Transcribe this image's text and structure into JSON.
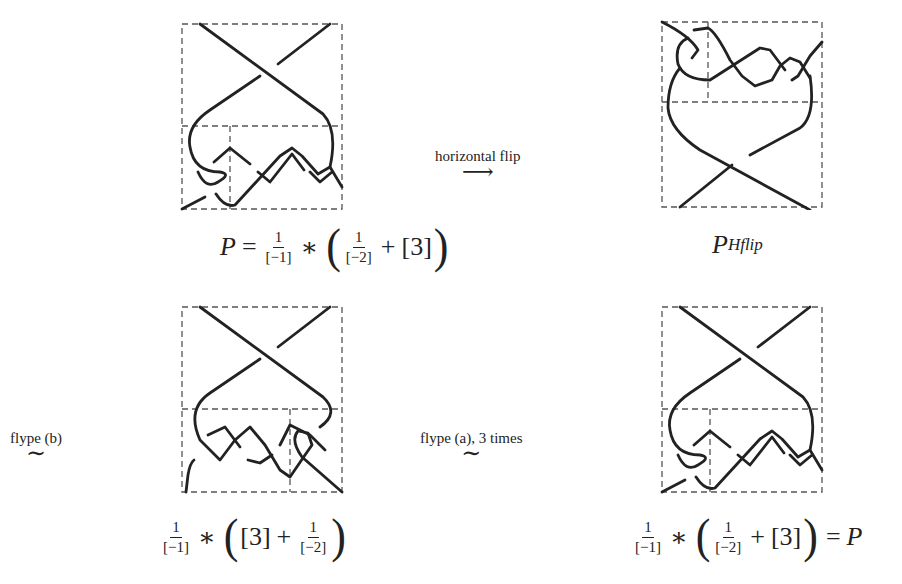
{
  "diagrams": [
    {
      "id": "P",
      "position": "top-left",
      "tangle": "lower-braid-with-curl-left",
      "formula": {
        "lhs": "P",
        "eq": "=",
        "frac1": {
          "num": "1",
          "den": "[−1]"
        },
        "star": "∗",
        "frac2": {
          "num": "1",
          "den": "[−2]"
        },
        "plus": "+",
        "term": "[3]"
      }
    },
    {
      "id": "P-Hflip",
      "position": "top-right",
      "tangle": "upper-braid-with-curl-left",
      "formula": {
        "base": "P",
        "superscript": "Hflip"
      }
    },
    {
      "id": "flype-b-result",
      "position": "bottom-left",
      "tangle": "lower-braid-with-curl-right",
      "formula": {
        "frac1": {
          "num": "1",
          "den": "[−1]"
        },
        "star": "∗",
        "term": "[3]",
        "plus": "+",
        "frac2": {
          "num": "1",
          "den": "[−2]"
        }
      }
    },
    {
      "id": "flype-a-result",
      "position": "bottom-right",
      "tangle": "lower-braid-with-curl-left",
      "formula": {
        "frac1": {
          "num": "1",
          "den": "[−1]"
        },
        "star": "∗",
        "frac2": {
          "num": "1",
          "den": "[−2]"
        },
        "plus": "+",
        "term": "[3]",
        "eq": "=",
        "rhs": "P"
      }
    }
  ],
  "transitions": {
    "horizontal_flip": {
      "label": "horizontal flip",
      "symbol": "⟶"
    },
    "flype_b": {
      "label": "flype (b)",
      "symbol": "∼"
    },
    "flype_a": {
      "label": "flype (a), 3 times",
      "symbol": "∼"
    }
  },
  "parens": {
    "open": "(",
    "close": ")"
  }
}
